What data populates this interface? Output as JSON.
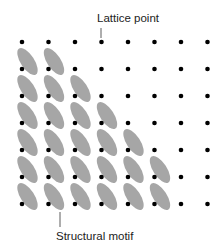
{
  "labels": {
    "top": "Lattice point",
    "bottom": "Structural motif"
  },
  "lattice": {
    "columns": 8,
    "rows": 7,
    "x0": 22,
    "y0": 42,
    "dx": 26.5,
    "dy": 27,
    "dot_color": "#000000",
    "motif_color": "#a6a6a6"
  },
  "motifs_per_row": [
    0,
    2,
    3,
    4,
    5,
    6,
    6
  ]
}
